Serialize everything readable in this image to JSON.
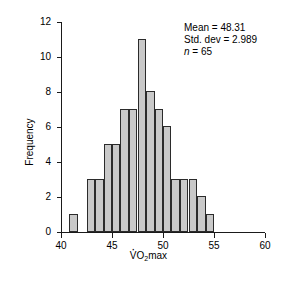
{
  "chart_data": {
    "type": "bar",
    "title": "",
    "xlabel": "VO2max",
    "xlabel_parts": {
      "v": "V",
      "o": "O",
      "sub": "2",
      "rest": "max"
    },
    "ylabel": "Frequency",
    "xlim": [
      40,
      60
    ],
    "ylim": [
      0,
      12
    ],
    "xticks": [
      40,
      45,
      50,
      55,
      60
    ],
    "yticks": [
      0,
      2,
      4,
      6,
      8,
      10,
      12
    ],
    "grid": false,
    "legend": false,
    "bin_width": 0.8333,
    "bar_fill_color": "#c9c9c9",
    "bar_edge_color": "#2b2b2b",
    "bars": [
      {
        "x0": 40.83,
        "x1": 41.67,
        "value": 1
      },
      {
        "x0": 42.5,
        "x1": 43.33,
        "value": 3
      },
      {
        "x0": 43.33,
        "x1": 44.17,
        "value": 3
      },
      {
        "x0": 44.17,
        "x1": 45.0,
        "value": 5
      },
      {
        "x0": 45.0,
        "x1": 45.83,
        "value": 5
      },
      {
        "x0": 45.83,
        "x1": 46.67,
        "value": 7
      },
      {
        "x0": 46.67,
        "x1": 47.5,
        "value": 7
      },
      {
        "x0": 47.5,
        "x1": 48.33,
        "value": 11
      },
      {
        "x0": 48.33,
        "x1": 49.17,
        "value": 8
      },
      {
        "x0": 49.17,
        "x1": 50.0,
        "value": 7
      },
      {
        "x0": 50.0,
        "x1": 50.83,
        "value": 6
      },
      {
        "x0": 50.83,
        "x1": 51.67,
        "value": 3
      },
      {
        "x0": 51.67,
        "x1": 52.5,
        "value": 3
      },
      {
        "x0": 52.5,
        "x1": 53.33,
        "value": 3
      },
      {
        "x0": 53.33,
        "x1": 54.17,
        "value": 2
      },
      {
        "x0": 54.17,
        "x1": 55.0,
        "value": 1
      }
    ],
    "annotations": {
      "mean_label": "Mean = 48.31",
      "stddev_label": "Std. dev = 2.989",
      "n_prefix": "n",
      "n_label": " = 65"
    }
  }
}
